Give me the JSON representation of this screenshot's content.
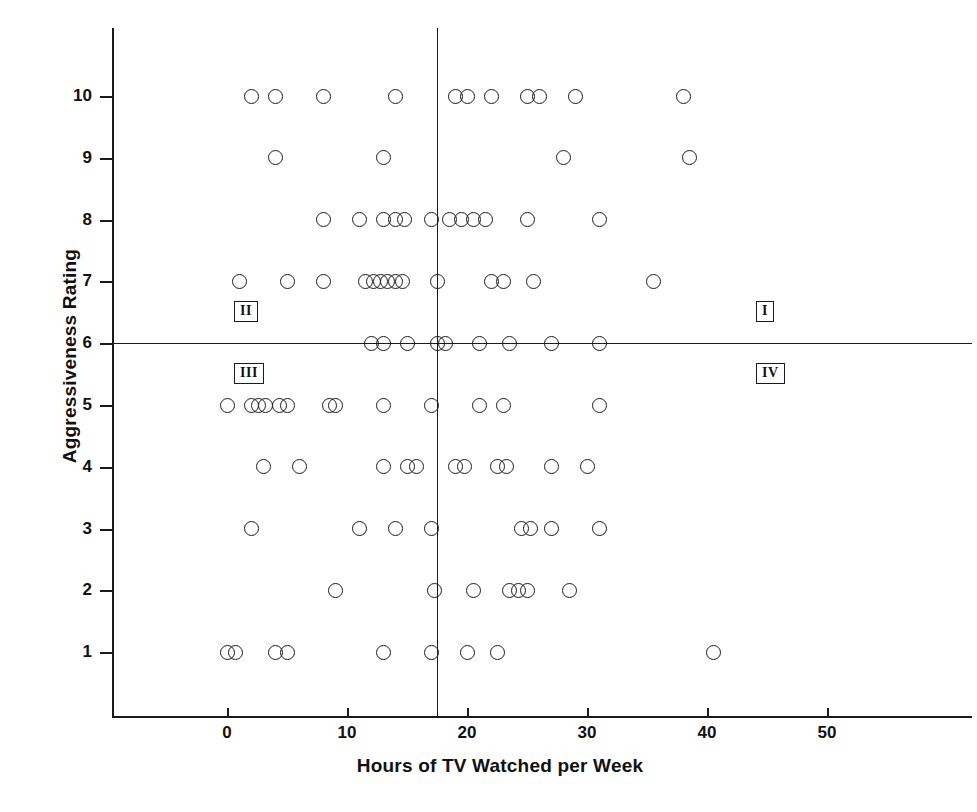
{
  "chart_data": {
    "type": "scatter",
    "title": "",
    "xlabel": "Hours of TV Watched per Week",
    "ylabel": "Aggressiveness Rating",
    "xlim": [
      -4,
      54
    ],
    "ylim": [
      0.2,
      11.2
    ],
    "xticks": [
      "0",
      "10",
      "20",
      "30",
      "40",
      "50"
    ],
    "xtick_values": [
      0,
      10,
      20,
      30,
      40,
      50
    ],
    "yticks": [
      "1",
      "2",
      "3",
      "4",
      "5",
      "6",
      "7",
      "8",
      "9",
      "10"
    ],
    "ytick_values": [
      1,
      2,
      3,
      4,
      5,
      6,
      7,
      8,
      9,
      10
    ],
    "grid": false,
    "legend": "none",
    "reference_lines": {
      "vertical_x": 17.5,
      "horizontal_y": 6
    },
    "marker": "open-circle",
    "points": [
      [
        2,
        10
      ],
      [
        4,
        10
      ],
      [
        8,
        10
      ],
      [
        14,
        10
      ],
      [
        19,
        10
      ],
      [
        20,
        10
      ],
      [
        22,
        10
      ],
      [
        25,
        10
      ],
      [
        26,
        10
      ],
      [
        29,
        10
      ],
      [
        38,
        10
      ],
      [
        4,
        9
      ],
      [
        13,
        9
      ],
      [
        28,
        9
      ],
      [
        38.5,
        9
      ],
      [
        8,
        8
      ],
      [
        11,
        8
      ],
      [
        13,
        8
      ],
      [
        14,
        8
      ],
      [
        14.8,
        8
      ],
      [
        17,
        8
      ],
      [
        18.5,
        8
      ],
      [
        19.5,
        8
      ],
      [
        20.5,
        8
      ],
      [
        21.5,
        8
      ],
      [
        25,
        8
      ],
      [
        31,
        8
      ],
      [
        1,
        7
      ],
      [
        5,
        7
      ],
      [
        8,
        7
      ],
      [
        11.5,
        7
      ],
      [
        12.2,
        7
      ],
      [
        12.8,
        7
      ],
      [
        13.4,
        7
      ],
      [
        14,
        7
      ],
      [
        14.6,
        7
      ],
      [
        17.5,
        7
      ],
      [
        22,
        7
      ],
      [
        23,
        7
      ],
      [
        25.5,
        7
      ],
      [
        35.5,
        7
      ],
      [
        12,
        6
      ],
      [
        13,
        6
      ],
      [
        15,
        6
      ],
      [
        17.5,
        6
      ],
      [
        18.2,
        6
      ],
      [
        21,
        6
      ],
      [
        23.5,
        6
      ],
      [
        27,
        6
      ],
      [
        31,
        6
      ],
      [
        0,
        5
      ],
      [
        2,
        5
      ],
      [
        2.6,
        5
      ],
      [
        3.2,
        5
      ],
      [
        4.4,
        5
      ],
      [
        5,
        5
      ],
      [
        8.5,
        5
      ],
      [
        9,
        5
      ],
      [
        13,
        5
      ],
      [
        17,
        5
      ],
      [
        21,
        5
      ],
      [
        23,
        5
      ],
      [
        31,
        5
      ],
      [
        3,
        4
      ],
      [
        6,
        4
      ],
      [
        13,
        4
      ],
      [
        15,
        4
      ],
      [
        15.8,
        4
      ],
      [
        19,
        4
      ],
      [
        19.8,
        4
      ],
      [
        22.5,
        4
      ],
      [
        23.3,
        4
      ],
      [
        27,
        4
      ],
      [
        30,
        4
      ],
      [
        2,
        3
      ],
      [
        11,
        3
      ],
      [
        14,
        3
      ],
      [
        17,
        3
      ],
      [
        24.5,
        3
      ],
      [
        25.3,
        3
      ],
      [
        27,
        3
      ],
      [
        31,
        3
      ],
      [
        9,
        2
      ],
      [
        17.3,
        2
      ],
      [
        20.5,
        2
      ],
      [
        23.5,
        2
      ],
      [
        24.3,
        2
      ],
      [
        25,
        2
      ],
      [
        28.5,
        2
      ],
      [
        0,
        1
      ],
      [
        0.7,
        1
      ],
      [
        4,
        1
      ],
      [
        5,
        1
      ],
      [
        13,
        1
      ],
      [
        17,
        1
      ],
      [
        20,
        1
      ],
      [
        22.5,
        1
      ],
      [
        40.5,
        1
      ]
    ],
    "quadrant_labels": [
      {
        "name": "I",
        "x": 45,
        "y": 6.5
      },
      {
        "name": "II",
        "x": 1.5,
        "y": 6.5
      },
      {
        "name": "III",
        "x": 1.5,
        "y": 5.5
      },
      {
        "name": "IV",
        "x": 45,
        "y": 5.5
      }
    ],
    "n_points": 98
  }
}
